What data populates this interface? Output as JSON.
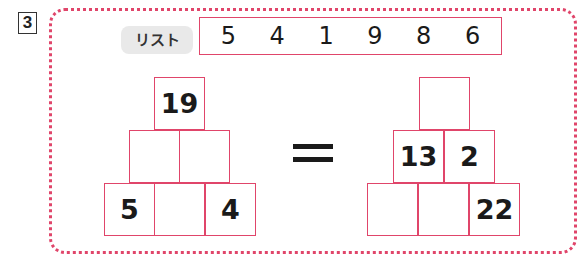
{
  "question_number": "3",
  "list": {
    "label": "リスト",
    "numbers": [
      "5",
      "4",
      "1",
      "9",
      "8",
      "6"
    ]
  },
  "left_pyramid": {
    "top": [
      "19"
    ],
    "middle": [
      "",
      ""
    ],
    "bottom": [
      "5",
      "",
      "4"
    ]
  },
  "equals_sign": "=",
  "right_pyramid": {
    "top": [
      ""
    ],
    "middle": [
      "13",
      "2"
    ],
    "bottom": [
      "",
      "",
      "22"
    ]
  },
  "colors": {
    "accent": "#e0456a",
    "label_bg": "#e9e9e9",
    "text": "#1a1a1a"
  }
}
